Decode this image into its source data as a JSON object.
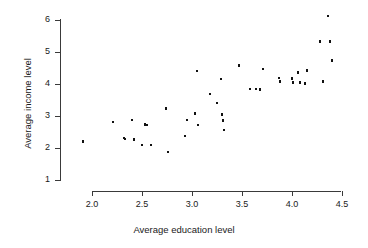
{
  "chart_data": {
    "type": "scatter",
    "title": "",
    "xlabel": "Average education level",
    "ylabel": "Average income level",
    "xlim": [
      1.85,
      4.55
    ],
    "ylim": [
      1.0,
      6.2
    ],
    "xticks": [
      2.0,
      2.5,
      3.0,
      3.5,
      4.0,
      4.5
    ],
    "xticklabels": [
      "2.0",
      "2.5",
      "3.0",
      "3.5",
      "4.0",
      "4.5"
    ],
    "yticks": [
      1,
      2,
      3,
      4,
      5,
      6
    ],
    "yticklabels": [
      "1",
      "2",
      "3",
      "4",
      "5",
      "6"
    ],
    "grid": false,
    "legend": null,
    "marker": "square",
    "marker_color": "#111111",
    "points": [
      {
        "x": 1.91,
        "y": 2.2
      },
      {
        "x": 2.21,
        "y": 2.81
      },
      {
        "x": 2.32,
        "y": 2.31
      },
      {
        "x": 2.33,
        "y": 2.28
      },
      {
        "x": 2.4,
        "y": 2.88
      },
      {
        "x": 2.42,
        "y": 2.26
      },
      {
        "x": 2.5,
        "y": 2.1
      },
      {
        "x": 2.53,
        "y": 2.73
      },
      {
        "x": 2.55,
        "y": 2.72
      },
      {
        "x": 2.59,
        "y": 2.09
      },
      {
        "x": 2.74,
        "y": 3.23
      },
      {
        "x": 2.76,
        "y": 1.88
      },
      {
        "x": 2.93,
        "y": 2.38
      },
      {
        "x": 2.95,
        "y": 2.88
      },
      {
        "x": 3.03,
        "y": 3.08
      },
      {
        "x": 3.05,
        "y": 4.4
      },
      {
        "x": 3.06,
        "y": 2.72
      },
      {
        "x": 3.18,
        "y": 3.69
      },
      {
        "x": 3.25,
        "y": 3.4
      },
      {
        "x": 3.29,
        "y": 4.16
      },
      {
        "x": 3.3,
        "y": 3.05
      },
      {
        "x": 3.31,
        "y": 2.86
      },
      {
        "x": 3.32,
        "y": 2.56
      },
      {
        "x": 3.47,
        "y": 4.58
      },
      {
        "x": 3.58,
        "y": 3.85
      },
      {
        "x": 3.64,
        "y": 3.85
      },
      {
        "x": 3.68,
        "y": 3.83
      },
      {
        "x": 3.71,
        "y": 4.47
      },
      {
        "x": 3.87,
        "y": 4.19
      },
      {
        "x": 3.88,
        "y": 4.07
      },
      {
        "x": 4.0,
        "y": 4.18
      },
      {
        "x": 4.01,
        "y": 4.05
      },
      {
        "x": 4.06,
        "y": 4.36
      },
      {
        "x": 4.08,
        "y": 4.04
      },
      {
        "x": 4.13,
        "y": 4.01
      },
      {
        "x": 4.15,
        "y": 4.43
      },
      {
        "x": 4.28,
        "y": 5.32
      },
      {
        "x": 4.31,
        "y": 4.08
      },
      {
        "x": 4.36,
        "y": 6.13
      },
      {
        "x": 4.38,
        "y": 5.33
      },
      {
        "x": 4.4,
        "y": 4.74
      }
    ]
  }
}
